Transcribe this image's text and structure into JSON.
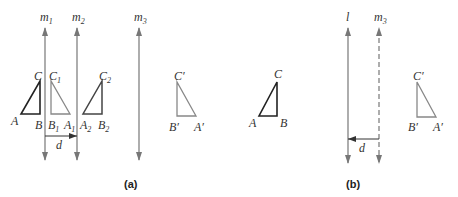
{
  "figure_a": {
    "caption": "(a)",
    "lines": [
      {
        "name": "m",
        "sub": "1",
        "x": 45
      },
      {
        "name": "m",
        "sub": "2",
        "x": 77
      },
      {
        "name": "m",
        "sub": "3",
        "x": 139
      }
    ],
    "distance_label": "d",
    "triangles": [
      {
        "id": "ABC",
        "color": "#222222",
        "labels": {
          "A": "A",
          "B": "B",
          "C": "C"
        }
      },
      {
        "id": "A1B1C1",
        "color": "#888888",
        "labels": {
          "A": "A",
          "A_sub": "1",
          "B": "B",
          "B_sub": "1",
          "C": "C",
          "C_sub": "1"
        }
      },
      {
        "id": "A2B2C2",
        "color": "#444444",
        "labels": {
          "A": "A",
          "A_sub": "2",
          "B": "B",
          "B_sub": "2",
          "C": "C",
          "C_sub": "2"
        }
      },
      {
        "id": "A'B'C'",
        "color": "#888888",
        "labels": {
          "A": "A′",
          "B": "B′",
          "C": "C′"
        }
      }
    ]
  },
  "middle": {
    "triangle": {
      "id": "ABC",
      "color": "#222222",
      "labels": {
        "A": "A",
        "B": "B",
        "C": "C"
      }
    }
  },
  "figure_b": {
    "caption": "(b)",
    "lines": [
      {
        "name": "l",
        "style": "solid",
        "x": 348
      },
      {
        "name": "m",
        "sub": "3",
        "style": "dashed",
        "x": 379
      }
    ],
    "distance_label": "d",
    "triangle": {
      "id": "A'B'C'",
      "color": "#888888",
      "labels": {
        "A": "A′",
        "B": "B′",
        "C": "C′"
      }
    }
  },
  "colors": {
    "line": "#777777",
    "dark_triangle": "#222222",
    "light_triangle": "#888888",
    "text": "#333333"
  }
}
